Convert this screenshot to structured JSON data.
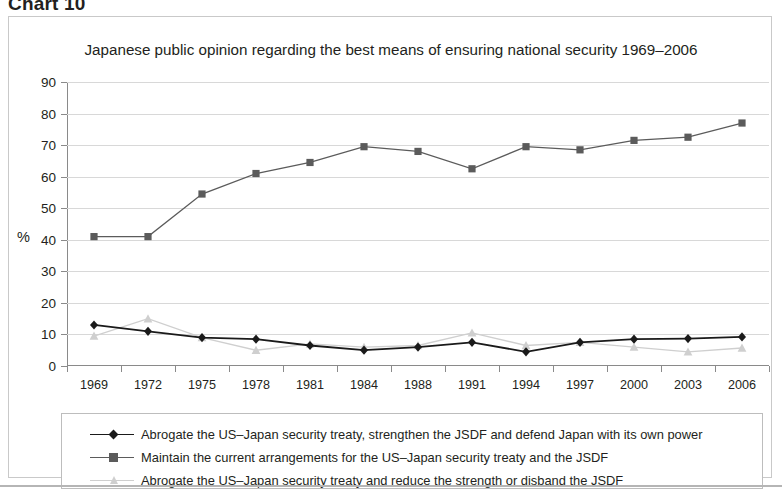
{
  "figure": {
    "chart_label": "Chart 10",
    "title": "Japanese public opinion regarding the best means of ensuring national security 1969–2006"
  },
  "axes": {
    "y_axis_title": "%",
    "y_ticks": [
      "90",
      "80",
      "70",
      "60",
      "50",
      "40",
      "30",
      "20",
      "10",
      "0"
    ],
    "x_ticks": [
      "1969",
      "1972",
      "1975",
      "1978",
      "1981",
      "1984",
      "1988",
      "1991",
      "1994",
      "1997",
      "2000",
      "2003",
      "2006"
    ]
  },
  "legend": {
    "items": [
      {
        "label": "Abrogate the US–Japan security treaty, strengthen the JSDF and defend Japan with its own power",
        "marker": "diamond-marker",
        "color": "#1a1a1a"
      },
      {
        "label": "Maintain the current arrangements for the US–Japan security treaty and the JSDF",
        "marker": "square-marker",
        "color": "#5b5b5b"
      },
      {
        "label": "Abrogate the US–Japan security treaty and reduce the strength or disband the JSDF",
        "marker": "triangle-marker",
        "color": "#cfcfcf"
      }
    ]
  },
  "chart_data": {
    "type": "line",
    "title": "Japanese public opinion regarding the best means of ensuring national security 1969–2006",
    "xlabel": "",
    "ylabel": "%",
    "ylim": [
      0,
      90
    ],
    "ytick_step": 10,
    "grid": true,
    "legend_position": "below-plot",
    "categories": [
      "1969",
      "1972",
      "1975",
      "1978",
      "1981",
      "1984",
      "1988",
      "1991",
      "1994",
      "1997",
      "2000",
      "2003",
      "2006"
    ],
    "series": [
      {
        "name": "Abrogate the US–Japan security treaty, strengthen the JSDF and defend Japan with its own power",
        "marker": "diamond",
        "color": "#1a1a1a",
        "values": [
          13.0,
          11.0,
          9.0,
          8.5,
          6.5,
          5.0,
          6.0,
          7.5,
          4.5,
          7.5,
          8.5,
          8.7,
          9.2
        ]
      },
      {
        "name": "Maintain the current arrangements for the US–Japan security treaty and the JSDF",
        "marker": "square",
        "color": "#5b5b5b",
        "values": [
          41.0,
          41.0,
          54.5,
          61.0,
          64.5,
          69.5,
          68.0,
          62.5,
          69.5,
          68.5,
          71.5,
          72.5,
          77.0
        ]
      },
      {
        "name": "Abrogate the US–Japan security treaty and reduce the strength or disband the JSDF",
        "marker": "triangle",
        "color": "#cfcfcf",
        "values": [
          9.5,
          15.0,
          9.0,
          5.0,
          7.0,
          6.0,
          6.5,
          10.5,
          6.5,
          7.5,
          6.0,
          4.5,
          5.7
        ]
      }
    ]
  }
}
